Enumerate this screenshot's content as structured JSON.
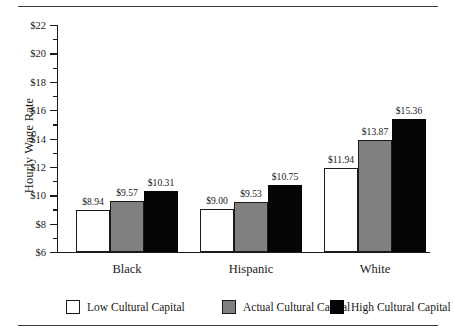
{
  "chart_data": {
    "type": "bar",
    "title": "",
    "xlabel": "",
    "ylabel": "Hourly Wage Rate",
    "ylim": [
      6,
      22
    ],
    "ytick_step": 2,
    "yminor_step": 1,
    "grid": false,
    "legend_position": "bottom",
    "value_prefix": "$",
    "categories": [
      "Black",
      "Hispanic",
      "White"
    ],
    "series": [
      {
        "name": "Low Cultural Capital",
        "color": "#ffffff",
        "edge_color": "#1a1a1a",
        "values": [
          8.94,
          9.0,
          11.94
        ],
        "labels": [
          "$8.94",
          "$9.00",
          "$11.94"
        ]
      },
      {
        "name": "Actual Cultural Capital",
        "color": "#808080",
        "edge_color": "#1a1a1a",
        "values": [
          9.57,
          9.53,
          13.87
        ],
        "labels": [
          "$9.57",
          "$9.53",
          "$13.87"
        ]
      },
      {
        "name": "High Cultural Capital",
        "color": "#050505",
        "edge_color": "#050505",
        "values": [
          10.31,
          10.75,
          15.36
        ],
        "labels": [
          "$10.31",
          "$10.75",
          "$15.36"
        ]
      }
    ],
    "ytick_labels": [
      "$6",
      "$8",
      "$10",
      "$12",
      "$14",
      "$16",
      "$18",
      "$20",
      "$22"
    ],
    "ytick_values": [
      6,
      8,
      10,
      12,
      14,
      16,
      18,
      20,
      22
    ],
    "yminor_values": [
      7,
      9,
      11,
      13,
      15,
      17,
      19,
      21
    ]
  },
  "legend": {
    "items": [
      {
        "label": "Low Cultural Capital",
        "style": "low"
      },
      {
        "label": "Actual Cultural Capital",
        "style": "actual"
      },
      {
        "label": "High Cultural Capital",
        "style": "high"
      }
    ]
  }
}
